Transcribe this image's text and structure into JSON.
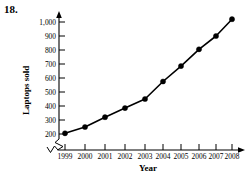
{
  "problem": {
    "number": "18."
  },
  "chart_data": {
    "type": "line",
    "title": "",
    "xlabel": "Year",
    "ylabel": "Laptops sold",
    "categories": [
      "1999",
      "2000",
      "2001",
      "2002",
      "2003",
      "2004",
      "2005",
      "2006",
      "2007",
      "2008"
    ],
    "values": [
      205,
      250,
      320,
      385,
      450,
      575,
      685,
      805,
      900,
      1020
    ],
    "yticks": [
      "200",
      "300",
      "400",
      "500",
      "600",
      "700",
      "800",
      "900",
      "1,000"
    ],
    "ytick_values": [
      200,
      300,
      400,
      500,
      600,
      700,
      800,
      900,
      1000
    ],
    "ylim": [
      170,
      1040
    ],
    "xlim": [
      "1999",
      "2008"
    ],
    "grid": false,
    "legend": false,
    "axis_break_y": true,
    "axis_break_x": true,
    "marker": "filled-circle",
    "line_color": "#000000",
    "marker_color": "#000000"
  },
  "axes": {
    "y_axis_name": "laptops-sold-axis",
    "x_axis_name": "year-axis"
  }
}
